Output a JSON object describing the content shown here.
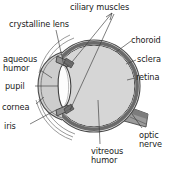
{
  "diagram": {
    "colors": {
      "text": "#1a1a1a",
      "leader_line": "#3a3a3a",
      "outline": "#4a4a4a",
      "sclera_ring": "#9a9a9a",
      "choroid_ring": "#6d6d6d",
      "retina_ring": "#4f4f4f",
      "vitreous_fill": "#d6d6d6",
      "aqueous_fill": "#cfcfcf",
      "lens_fill": "#fdfdfd",
      "optic_nerve_fill": "#8c8c8c",
      "background": "#ffffff"
    },
    "labels": [
      {
        "id": "ciliary",
        "text": "ciliary muscles",
        "name": "label-ciliary-muscles"
      },
      {
        "id": "crystal",
        "text": "crystalline lens",
        "name": "label-crystalline-lens"
      },
      {
        "id": "aqueous",
        "text": "aqueous\nhumor",
        "line1": "aqueous",
        "line2": "humor",
        "name": "label-aqueous-humor"
      },
      {
        "id": "pupil",
        "text": "pupil",
        "name": "label-pupil"
      },
      {
        "id": "cornea",
        "text": "cornea",
        "name": "label-cornea"
      },
      {
        "id": "iris",
        "text": "iris",
        "name": "label-iris"
      },
      {
        "id": "choroid",
        "text": "choroid",
        "name": "label-choroid"
      },
      {
        "id": "sclera",
        "text": "sclera",
        "name": "label-sclera"
      },
      {
        "id": "retina",
        "text": "retina",
        "name": "label-retina"
      },
      {
        "id": "optic",
        "text": "optic\nnerve",
        "line1": "optic",
        "line2": "nerve",
        "name": "label-optic-nerve"
      },
      {
        "id": "vitreous",
        "text": "vitreous\nhumor",
        "line1": "vitreous",
        "line2": "humor",
        "name": "label-vitreous-humor"
      }
    ],
    "parts": {
      "ciliary_muscles": "ciliary muscles",
      "crystalline_lens": "crystalline lens",
      "aqueous_humor_l1": "aqueous",
      "aqueous_humor_l2": "humor",
      "pupil": "pupil",
      "cornea": "cornea",
      "iris": "iris",
      "choroid": "choroid",
      "sclera": "sclera",
      "retina": "retina",
      "optic_nerve_l1": "optic",
      "optic_nerve_l2": "nerve",
      "vitreous_humor_l1": "vitreous",
      "vitreous_humor_l2": "humor"
    }
  }
}
